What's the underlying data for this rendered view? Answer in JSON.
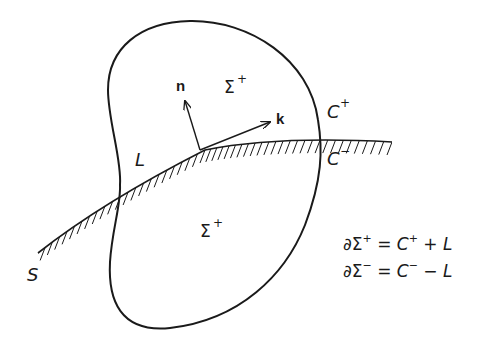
{
  "diagram": {
    "labels": {
      "normal_vector": "n",
      "tangent_vector": "k",
      "region_upper": "Σ",
      "region_upper_sup": "+",
      "region_lower": "Σ",
      "region_lower_sup": "+",
      "curve_upper": "C",
      "curve_upper_sup": "+",
      "curve_lower": "C",
      "curve_lower_sup": "−",
      "intersection_line": "L",
      "surface": "S"
    },
    "equations": [
      {
        "lhs": "∂Σ",
        "lhs_sup": "+",
        "eq": " = ",
        "c": "C",
        "c_sup": "+",
        "op": " + ",
        "l": "L"
      },
      {
        "lhs": "∂Σ",
        "lhs_sup": "−",
        "eq": " = ",
        "c": "C",
        "c_sup": "−",
        "op": " − ",
        "l": "L"
      }
    ],
    "colors": {
      "stroke": "#1a1a1a",
      "background": "#ffffff"
    }
  }
}
